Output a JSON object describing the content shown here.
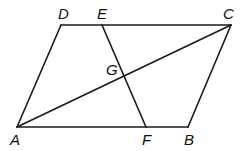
{
  "figure": {
    "type": "parallelogram-geometry",
    "points": {
      "A": {
        "label": "A",
        "x": 17,
        "y": 127,
        "lx": 10,
        "ly": 145
      },
      "B": {
        "label": "B",
        "x": 188,
        "y": 127,
        "lx": 184,
        "ly": 145
      },
      "C": {
        "label": "C",
        "x": 231,
        "y": 25,
        "lx": 223,
        "ly": 19
      },
      "D": {
        "label": "D",
        "x": 61,
        "y": 25,
        "lx": 58,
        "ly": 19
      },
      "E": {
        "label": "E",
        "x": 102,
        "y": 25,
        "lx": 97,
        "ly": 19
      },
      "F": {
        "label": "F",
        "x": 146,
        "y": 127,
        "lx": 142,
        "ly": 145
      },
      "G": {
        "label": "G",
        "x": 124,
        "y": 77,
        "lx": 106,
        "ly": 75
      }
    },
    "segments": [
      [
        "A",
        "B"
      ],
      [
        "B",
        "C"
      ],
      [
        "C",
        "D"
      ],
      [
        "D",
        "A"
      ],
      [
        "A",
        "C"
      ],
      [
        "E",
        "F"
      ]
    ]
  }
}
